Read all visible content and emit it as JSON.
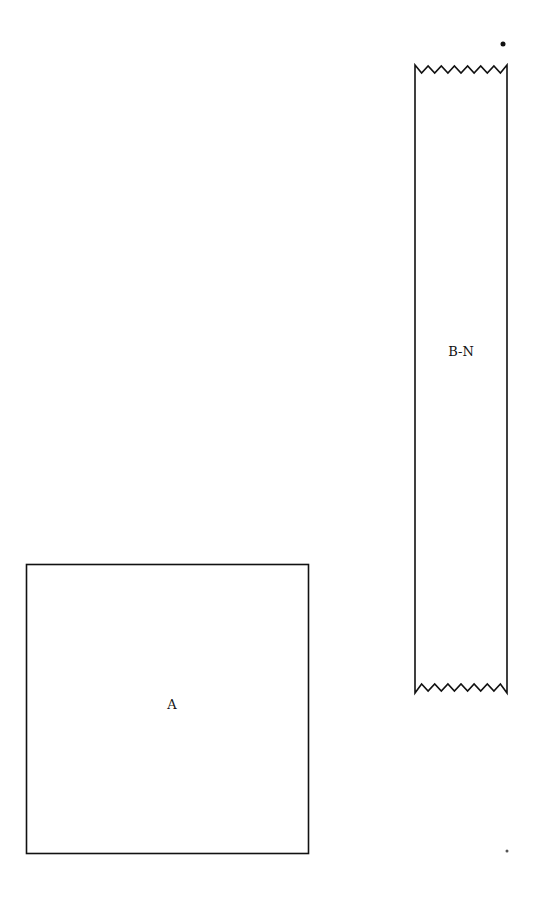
{
  "diagram": {
    "shapes": [
      {
        "id": "A",
        "type": "square",
        "label": "A",
        "x": 26,
        "y": 564,
        "width": 282,
        "height": 289
      },
      {
        "id": "B-N",
        "type": "strip-with-torn-ends",
        "label": "B-N",
        "x": 415,
        "y": 65,
        "width": 92,
        "height": 628,
        "zigzag_teeth": 7
      }
    ],
    "marks": [
      {
        "name": "dot-top-right",
        "x": 503,
        "y": 44,
        "r": 2.5
      },
      {
        "name": "dot-bottom-right",
        "x": 507,
        "y": 851,
        "r": 1.5
      }
    ],
    "colors": {
      "stroke": "#111111",
      "background": "#ffffff"
    }
  }
}
